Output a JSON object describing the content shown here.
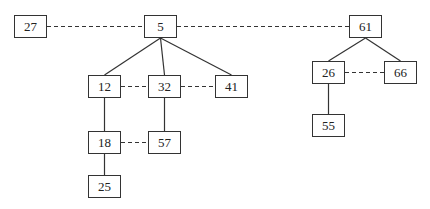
{
  "diagram": {
    "type": "heap-forest",
    "nodes": [
      {
        "id": "n27",
        "label": "27",
        "x": 14,
        "y": 15
      },
      {
        "id": "n5",
        "label": "5",
        "x": 144,
        "y": 15
      },
      {
        "id": "n61",
        "label": "61",
        "x": 349,
        "y": 15
      },
      {
        "id": "n12",
        "label": "12",
        "x": 88,
        "y": 75
      },
      {
        "id": "n32",
        "label": "32",
        "x": 148,
        "y": 75
      },
      {
        "id": "n41",
        "label": "41",
        "x": 215,
        "y": 75
      },
      {
        "id": "n26",
        "label": "26",
        "x": 312,
        "y": 61
      },
      {
        "id": "n66",
        "label": "66",
        "x": 384,
        "y": 61
      },
      {
        "id": "n55",
        "label": "55",
        "x": 312,
        "y": 114
      },
      {
        "id": "n18",
        "label": "18",
        "x": 88,
        "y": 131
      },
      {
        "id": "n57",
        "label": "57",
        "x": 148,
        "y": 131
      },
      {
        "id": "n25",
        "label": "25",
        "x": 88,
        "y": 175
      }
    ],
    "solid_edges": [
      [
        "n5",
        "n12"
      ],
      [
        "n5",
        "n32"
      ],
      [
        "n5",
        "n41"
      ],
      [
        "n12",
        "n18"
      ],
      [
        "n32",
        "n57"
      ],
      [
        "n18",
        "n25"
      ],
      [
        "n61",
        "n26"
      ],
      [
        "n61",
        "n66"
      ],
      [
        "n26",
        "n55"
      ]
    ],
    "dashed_edges": [
      [
        "n27",
        "n5"
      ],
      [
        "n5",
        "n61"
      ],
      [
        "n12",
        "n32"
      ],
      [
        "n32",
        "n41"
      ],
      [
        "n18",
        "n57"
      ],
      [
        "n26",
        "n66"
      ]
    ],
    "colors": {
      "stroke": "#333333",
      "text": "#222222",
      "background": "#ffffff"
    }
  }
}
